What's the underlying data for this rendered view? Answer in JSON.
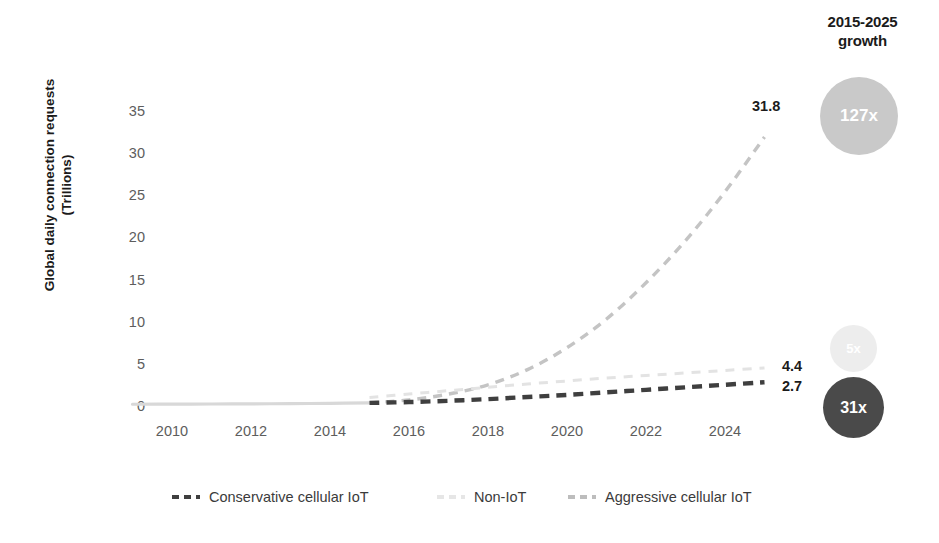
{
  "growth_header": {
    "line1": "2015-2025",
    "line2": "growth"
  },
  "axis": {
    "y_title_line1": "Global daily connection requests",
    "y_title_line2": "(Trillions)",
    "y_ticks": [
      "0",
      "5",
      "10",
      "15",
      "20",
      "25",
      "30",
      "35"
    ],
    "x_ticks": [
      "2010",
      "2012",
      "2014",
      "2016",
      "2018",
      "2020",
      "2022",
      "2024"
    ]
  },
  "point_labels": {
    "aggressive": "31.8",
    "non_iot": "4.4",
    "conservative": "2.7"
  },
  "bubbles": [
    {
      "label": "127x",
      "series": "Aggressive cellular IoT",
      "color": "#c9c9c9"
    },
    {
      "label": "5x",
      "series": "Non-IoT",
      "color": "#ededed"
    },
    {
      "label": "31x",
      "series": "Conservative cellular IoT",
      "color": "#4a4a4a"
    }
  ],
  "legend": [
    {
      "label": "Conservative cellular IoT",
      "color": "#3f3f3f"
    },
    {
      "label": "Non-IoT",
      "color": "#e6e6e6"
    },
    {
      "label": "Aggressive cellular IoT",
      "color": "#bdbdbd"
    }
  ],
  "colors": {
    "conservative": "#3f3f3f",
    "non_iot": "#e3e3e3",
    "aggressive": "#c4c4c4",
    "history": "#d8d8d8",
    "tick_text": "#5d5d5d",
    "title_text": "#1b1b1b",
    "background": "#ffffff"
  },
  "chart_data": {
    "type": "line",
    "title": "",
    "subtitle": "",
    "xlabel": "",
    "ylabel": "Global daily connection requests (Trillions)",
    "xlim": [
      2009,
      2025
    ],
    "ylim": [
      0,
      36
    ],
    "grid": false,
    "legend_position": "bottom",
    "x": [
      2009,
      2010,
      2011,
      2012,
      2013,
      2014,
      2015,
      2016,
      2017,
      2018,
      2019,
      2020,
      2021,
      2022,
      2023,
      2024,
      2025
    ],
    "forecast_start_year": 2015,
    "series": [
      {
        "name": "Conservative cellular IoT",
        "color": "#3f3f3f",
        "style": "dashed",
        "end_label": "2.7",
        "growth_label": "31x",
        "values": [
          0.09,
          0.1,
          0.12,
          0.14,
          0.16,
          0.2,
          0.25,
          0.35,
          0.5,
          0.7,
          0.95,
          1.2,
          1.5,
          1.8,
          2.1,
          2.4,
          2.7
        ]
      },
      {
        "name": "Non-IoT",
        "color": "#e3e3e3",
        "style": "dashed",
        "end_label": "4.4",
        "growth_label": "5x",
        "values": [
          0.09,
          0.1,
          0.12,
          0.14,
          0.18,
          0.24,
          0.9,
          1.3,
          1.7,
          2.1,
          2.5,
          2.85,
          3.2,
          3.5,
          3.8,
          4.1,
          4.4
        ]
      },
      {
        "name": "Aggressive cellular IoT",
        "color": "#c4c4c4",
        "style": "dashed",
        "end_label": "31.8",
        "growth_label": "127x",
        "values": [
          0.09,
          0.1,
          0.12,
          0.14,
          0.18,
          0.22,
          0.25,
          0.6,
          1.3,
          2.4,
          4.2,
          6.8,
          10.2,
          14.5,
          19.5,
          25.3,
          31.8
        ]
      }
    ],
    "annotations": [
      {
        "text": "2015-2025 growth",
        "position": "top-right"
      },
      {
        "text": "31.8",
        "series": "Aggressive cellular IoT",
        "at_x": 2025
      },
      {
        "text": "4.4",
        "series": "Non-IoT",
        "at_x": 2025
      },
      {
        "text": "2.7",
        "series": "Conservative cellular IoT",
        "at_x": 2025
      }
    ]
  }
}
